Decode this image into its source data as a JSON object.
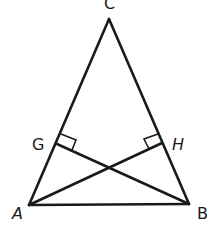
{
  "diagram": {
    "type": "geometry",
    "points": {
      "A": {
        "label": "A",
        "x": 29,
        "y": 205
      },
      "B": {
        "label": "B",
        "x": 189,
        "y": 204
      },
      "C": {
        "label": "C",
        "x": 109,
        "y": 19
      },
      "G": {
        "label": "G",
        "x": 57,
        "y": 144
      },
      "H": {
        "label": "H",
        "x": 162,
        "y": 143
      }
    },
    "segments": [
      "AB",
      "BC",
      "CA",
      "BG",
      "AH"
    ],
    "right_angles": [
      "G",
      "H"
    ],
    "labels": {
      "A": "A",
      "B": "B",
      "C": "C",
      "G": "G",
      "H": "H"
    },
    "colors": {
      "stroke": "#1a1a1a",
      "background": "#ffffff"
    }
  }
}
